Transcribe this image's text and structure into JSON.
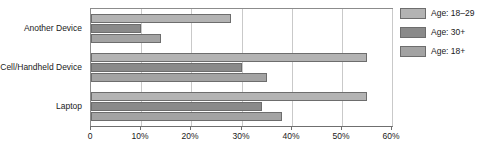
{
  "chart_data": {
    "type": "bar",
    "orientation": "horizontal",
    "title": "",
    "subtitle": "",
    "xlabel": "",
    "ylabel": "",
    "categories": [
      "Another Device",
      "Cell/Handheld Device",
      "Laptop"
    ],
    "series": [
      {
        "name": "Age: 18–29",
        "values": [
          28,
          55,
          55
        ],
        "color": "#b3b3b3"
      },
      {
        "name": "Age: 30+",
        "values": [
          10,
          30,
          34
        ],
        "color": "#8a8a8a"
      },
      {
        "name": "Age: 18+",
        "values": [
          14,
          35,
          38
        ],
        "color": "#a3a3a3"
      }
    ],
    "xlim": [
      0,
      60
    ],
    "xticks": [
      0,
      10,
      20,
      30,
      40,
      50,
      60
    ],
    "xtick_labels": [
      "0",
      "10%",
      "20%",
      "30%",
      "40%",
      "50%",
      "60%"
    ],
    "grid": true,
    "grid_axis": "x",
    "legend_position": "right",
    "value_unit": "%"
  },
  "legend": {
    "items": [
      {
        "label": "Age: 18–29"
      },
      {
        "label": "Age: 30+"
      },
      {
        "label": "Age: 18+"
      }
    ]
  },
  "colors": {
    "series_light": "#b3b3b3",
    "series_dark": "#8a8a8a",
    "series_medium": "#a3a3a3",
    "bar_outline": "#6d6d6d",
    "gridline": "#c9c9c9",
    "axis_line": "#6f6f6f",
    "plot_border": "#8c8c8c",
    "text": "#1a1a1a",
    "background": "#ffffff"
  }
}
